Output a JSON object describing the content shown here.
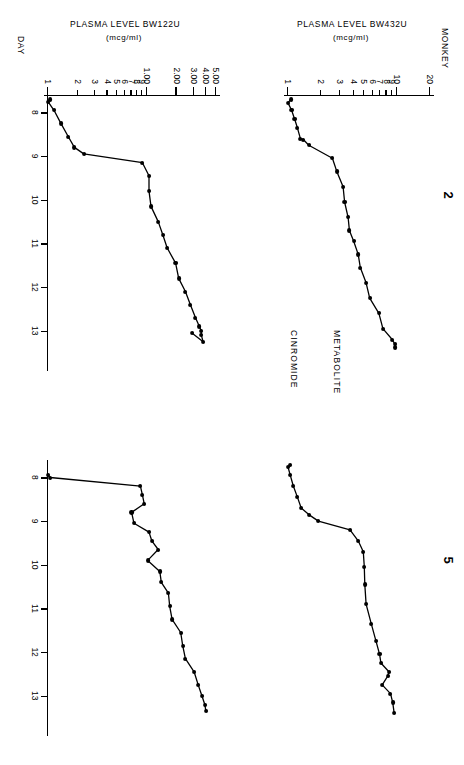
{
  "figure": {
    "monkey_axis_label": "MONKEY",
    "day_axis_label": "DAY",
    "panel_titles": [
      "2",
      "5"
    ],
    "row_labels": [
      "METABOLITE",
      "CINROMIDE"
    ]
  },
  "chart_data": [
    {
      "type": "line",
      "title": "2",
      "subject": "MONKEY 2",
      "series_name": "METABOLITE",
      "ylabel": "PLASMA LEVEL BW432U",
      "yunits": "(mcg/ml)",
      "xlabel": "DAY",
      "yscale": "log",
      "ylim": [
        1,
        20
      ],
      "xlim": [
        7.6,
        13.6
      ],
      "ytick_labels": [
        "20",
        "10",
        "9",
        "8",
        "7",
        "6",
        "5",
        "4",
        "3",
        "2",
        "1"
      ],
      "ytick_values": [
        20,
        10,
        9,
        8,
        7,
        6,
        5,
        4,
        3,
        2,
        1
      ],
      "xtick_labels": [
        "8",
        "9",
        "10",
        "11",
        "12",
        "13"
      ],
      "xtick_values": [
        8,
        9,
        10,
        11,
        12,
        13
      ],
      "grid": false,
      "legend": "none",
      "x": [
        7.7,
        7.78,
        7.95,
        8.15,
        8.35,
        8.6,
        8.62,
        8.75,
        9.05,
        9.35,
        9.7,
        10.05,
        10.4,
        10.7,
        10.95,
        11.25,
        11.55,
        11.9,
        12.25,
        12.6,
        12.95,
        13.2,
        13.3,
        13.38
      ],
      "y": [
        1.06,
        1.0,
        1.08,
        1.15,
        1.22,
        1.3,
        1.38,
        1.55,
        2.55,
        2.8,
        3.2,
        3.3,
        3.55,
        3.65,
        4.0,
        4.4,
        4.6,
        5.2,
        5.6,
        6.8,
        7.4,
        9.0,
        9.5,
        9.6
      ]
    },
    {
      "type": "line",
      "title": "5",
      "subject": "MONKEY 5",
      "series_name": "METABOLITE",
      "ylabel": "PLASMA LEVEL BW432U",
      "yunits": "(mcg/ml)",
      "xlabel": "DAY",
      "yscale": "log",
      "ylim": [
        1,
        20
      ],
      "xlim": [
        7.6,
        13.6
      ],
      "ytick_labels": [
        "20",
        "10",
        "9",
        "8",
        "7",
        "6",
        "5",
        "4",
        "3",
        "2",
        "1"
      ],
      "ytick_values": [
        20,
        10,
        9,
        8,
        7,
        6,
        5,
        4,
        3,
        2,
        1
      ],
      "xtick_labels": [
        "8",
        "9",
        "10",
        "11",
        "12",
        "13"
      ],
      "xtick_values": [
        8,
        9,
        10,
        11,
        12,
        13
      ],
      "grid": false,
      "legend": "none",
      "x": [
        7.72,
        7.76,
        7.95,
        8.2,
        8.45,
        8.7,
        8.85,
        9.0,
        9.2,
        9.45,
        9.7,
        10.05,
        10.45,
        10.9,
        11.35,
        11.75,
        12.05,
        12.25,
        12.45,
        12.55,
        12.75,
        12.95,
        13.15,
        13.4
      ],
      "y": [
        1.05,
        1.0,
        1.05,
        1.12,
        1.22,
        1.32,
        1.55,
        1.9,
        3.7,
        4.4,
        4.9,
        5.0,
        5.05,
        5.2,
        5.8,
        6.4,
        6.9,
        7.1,
        8.4,
        8.2,
        7.3,
        8.7,
        9.1,
        9.4
      ]
    },
    {
      "type": "line",
      "title": "2",
      "subject": "MONKEY 2",
      "series_name": "CINROMIDE",
      "ylabel": "PLASMA LEVEL BW122U",
      "yunits": "(mcg/ml)",
      "xlabel": "DAY",
      "yscale": "log",
      "ylim": [
        1,
        5
      ],
      "ytick_labels": [
        "5.00",
        "4.00",
        "3.00",
        "2.00",
        "1.00",
        "9",
        "8",
        "7",
        "6",
        "5",
        "4",
        "3",
        "2",
        "1"
      ],
      "ytick_values": [
        5.0,
        4.0,
        3.0,
        2.0,
        1.0,
        0.9,
        0.8,
        0.7,
        0.6,
        0.5,
        0.4,
        0.3,
        0.2,
        0.1
      ],
      "xtick_labels": [
        "8",
        "9",
        "10",
        "11",
        "12",
        "13"
      ],
      "xtick_values": [
        8,
        9,
        10,
        11,
        12,
        13
      ],
      "grid": false,
      "legend": "none",
      "x": [
        7.7,
        7.75,
        7.95,
        8.25,
        8.55,
        8.8,
        8.95,
        9.15,
        9.45,
        9.8,
        10.15,
        10.5,
        10.8,
        11.1,
        11.45,
        11.8,
        12.1,
        12.4,
        12.7,
        12.9,
        13.0,
        13.1,
        13.25,
        13.05
      ],
      "y": [
        0.105,
        0.1,
        0.115,
        0.135,
        0.16,
        0.185,
        0.23,
        0.9,
        1.05,
        1.05,
        1.1,
        1.3,
        1.45,
        1.6,
        1.95,
        2.1,
        2.45,
        2.75,
        3.1,
        3.4,
        3.55,
        3.55,
        3.7,
        2.85
      ]
    },
    {
      "type": "line",
      "title": "5",
      "subject": "MONKEY 5",
      "series_name": "CINROMIDE",
      "ylabel": "PLASMA LEVEL BW122U",
      "yunits": "(mcg/ml)",
      "xlabel": "DAY",
      "yscale": "log",
      "ylim": [
        1,
        5
      ],
      "ytick_labels": [
        "5.00",
        "4.00",
        "3.00",
        "2.00",
        "1.00",
        "9",
        "8",
        "7",
        "6",
        "5",
        "4",
        "3",
        "2",
        "1"
      ],
      "ytick_values": [
        5.0,
        4.0,
        3.0,
        2.0,
        1.0,
        0.9,
        0.8,
        0.7,
        0.6,
        0.5,
        0.4,
        0.3,
        0.2,
        0.1
      ],
      "xtick_labels": [
        "8",
        "9",
        "10",
        "11",
        "12",
        "13"
      ],
      "xtick_values": [
        8,
        9,
        10,
        11,
        12,
        13
      ],
      "grid": false,
      "legend": "none",
      "x": [
        7.95,
        8.0,
        8.2,
        8.4,
        8.6,
        8.8,
        9.05,
        9.25,
        9.45,
        9.65,
        9.9,
        10.15,
        10.4,
        10.65,
        10.95,
        11.25,
        11.55,
        11.85,
        12.15,
        12.45,
        12.75,
        13.0,
        13.2,
        13.35
      ],
      "y": [
        0.1,
        0.105,
        0.86,
        0.9,
        0.94,
        0.7,
        0.74,
        1.05,
        1.12,
        1.3,
        1.02,
        1.35,
        1.4,
        1.65,
        1.7,
        1.8,
        2.2,
        2.3,
        2.45,
        3.0,
        3.3,
        3.6,
        3.85,
        3.95
      ]
    }
  ]
}
